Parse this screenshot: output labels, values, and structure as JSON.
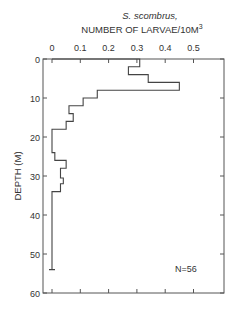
{
  "chart_data": {
    "type": "step",
    "title": "S. scombrus,",
    "xlabel": "NUMBER OF LARVAE/10M",
    "xlabel_superscript": "3",
    "ylabel": "DEPTH (M)",
    "annotation": "N=56",
    "xlim": [
      0,
      0.55
    ],
    "ylim": [
      0,
      60
    ],
    "y_inverted": true,
    "x_axis_position": "top",
    "xticks": [
      0,
      0.1,
      0.2,
      0.3,
      0.4,
      0.5
    ],
    "xtick_labels": [
      "0",
      "0.1",
      "0.2",
      "0.3",
      "0.4",
      "0.5"
    ],
    "yticks": [
      0,
      10,
      20,
      30,
      40,
      50,
      60
    ],
    "ytick_labels": [
      "0",
      "10",
      "20",
      "30",
      "40",
      "50",
      "60"
    ],
    "sampled_depth_range_m": [
      0,
      54
    ],
    "series": [
      {
        "name": "larvae density",
        "depth_bins_m": [
          [
            0,
            2
          ],
          [
            2,
            4
          ],
          [
            4,
            6
          ],
          [
            6,
            8
          ],
          [
            8,
            10
          ],
          [
            10,
            12
          ],
          [
            12,
            14
          ],
          [
            14,
            16
          ],
          [
            16,
            18
          ],
          [
            18,
            24
          ],
          [
            24,
            26
          ],
          [
            26,
            28
          ],
          [
            28,
            30.5
          ],
          [
            30.5,
            32
          ],
          [
            32,
            34
          ],
          [
            34,
            54
          ]
        ],
        "values": [
          0.31,
          0.27,
          0.34,
          0.45,
          0.16,
          0.11,
          0.06,
          0.075,
          0.05,
          0,
          0.01,
          0.05,
          0.03,
          0.04,
          0.03,
          0
        ]
      }
    ],
    "grid": false,
    "legend": null
  }
}
